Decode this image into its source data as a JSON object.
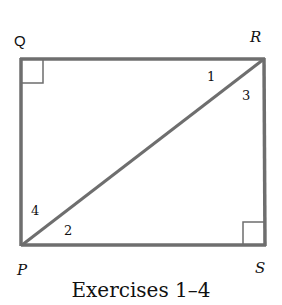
{
  "diagram": {
    "type": "rectangle with diagonal",
    "line_color": "#6e6e6e",
    "vertices": [
      {
        "name": "Q",
        "x": 21,
        "y": 59
      },
      {
        "name": "R",
        "x": 264,
        "y": 59
      },
      {
        "name": "S",
        "x": 265,
        "y": 245
      },
      {
        "name": "P",
        "x": 22,
        "y": 245
      }
    ],
    "labels": {
      "Q": "Q",
      "R": "R",
      "S": "S",
      "P": "P"
    },
    "angles": {
      "a1": "1",
      "a2": "2",
      "a3": "3",
      "a4": "4"
    },
    "right_angles": [
      "Q",
      "S"
    ],
    "diagonal": "PR"
  },
  "caption": "Exercises 1–4"
}
